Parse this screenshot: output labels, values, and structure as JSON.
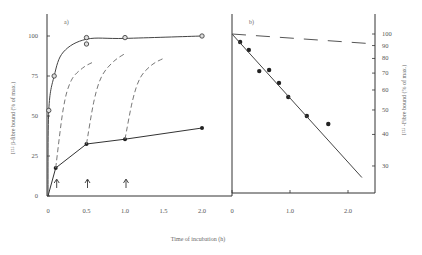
{
  "figure": {
    "xlabel": "Time of incubation (h)"
  },
  "chart_data": [
    {
      "type": "line",
      "panel_label": "a)",
      "xlabel": "Time of incubation (h)",
      "ylabel": "I¹²⁵ β-fibre bound (% of max.)",
      "xlim": [
        0,
        2.0
      ],
      "ylim": [
        0,
        100
      ],
      "x_ticks": [
        "0",
        "0.5",
        "1.0",
        "1.5",
        "2.0"
      ],
      "y_ticks": [
        "0",
        "25",
        "50",
        "75",
        "100"
      ],
      "series": [
        {
          "name": "total binding (open circles)",
          "marker": "open-circle",
          "style": "solid",
          "points": [
            [
              0,
              0
            ],
            [
              0.01,
              53.5
            ],
            [
              0.08,
              75
            ],
            [
              0.5,
              99
            ],
            [
              0.5,
              95
            ],
            [
              1.0,
              99
            ],
            [
              2.0,
              100
            ]
          ]
        },
        {
          "name": "binding (filled circles)",
          "marker": "filled-circle",
          "style": "solid",
          "points": [
            [
              0,
              0
            ],
            [
              0.1,
              17.5
            ],
            [
              0.5,
              32.5
            ],
            [
              1.0,
              35.5
            ],
            [
              2.0,
              42.5
            ]
          ]
        },
        {
          "name": "dashed curve from 0.1 h",
          "style": "dashed",
          "points": [
            [
              0.1,
              17.5
            ],
            [
              0.2,
              55
            ],
            [
              0.3,
              72
            ],
            [
              0.45,
              80
            ],
            [
              0.6,
              84
            ]
          ]
        },
        {
          "name": "dashed curve from 0.5 h",
          "style": "dashed",
          "points": [
            [
              0.5,
              32.5
            ],
            [
              0.6,
              60
            ],
            [
              0.7,
              75
            ],
            [
              0.85,
              84
            ],
            [
              1.0,
              89
            ]
          ]
        },
        {
          "name": "dashed curve from 1.0 h",
          "style": "dashed",
          "points": [
            [
              1.0,
              35.5
            ],
            [
              1.1,
              60
            ],
            [
              1.2,
              74
            ],
            [
              1.35,
              82
            ],
            [
              1.5,
              86
            ]
          ]
        }
      ],
      "annotations": [
        {
          "type": "arrow-up",
          "x": 0.1
        },
        {
          "type": "arrow-up",
          "x": 0.5
        },
        {
          "type": "arrow-up",
          "x": 1.0
        }
      ]
    },
    {
      "type": "scatter",
      "panel_label": "b)",
      "xlabel": "Time of incubation (h)",
      "ylabel": "I¹²⁵ -Fibre bound (% of max.)",
      "yscale": "log",
      "xlim": [
        0,
        2.5
      ],
      "ylim": [
        25,
        100
      ],
      "x_ticks": [
        "0",
        "1.0",
        "2.0"
      ],
      "y_ticks": [
        "30",
        "40",
        "50",
        "60",
        "70",
        "80",
        "90",
        "100"
      ],
      "series": [
        {
          "name": "data points",
          "marker": "filled-circle",
          "points": [
            [
              0.14,
              93
            ],
            [
              0.29,
              86.5
            ],
            [
              0.47,
              71.3
            ],
            [
              0.64,
              72
            ],
            [
              0.81,
              64
            ],
            [
              0.97,
              56.3
            ],
            [
              1.29,
              47.3
            ],
            [
              1.66,
              44
            ]
          ]
        },
        {
          "name": "fitted line",
          "style": "solid",
          "points": [
            [
              0,
              100
            ],
            [
              2.24,
              27
            ]
          ]
        },
        {
          "name": "dashed reference line",
          "style": "dashed",
          "points": [
            [
              0,
              100
            ],
            [
              2.47,
              91.3
            ]
          ]
        }
      ]
    }
  ]
}
